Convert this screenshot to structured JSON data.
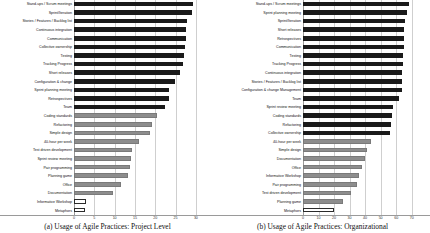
{
  "figure": {
    "caption_left": "(a) Usage of Agile Practices: Project Level",
    "caption_right": "(b) Usage of Agile Practices: Organizational"
  },
  "chart_data": [
    {
      "type": "bar",
      "title": "",
      "orientation": "horizontal",
      "panel": "a",
      "xlabel": "",
      "ylabel": "",
      "xlim": [
        0,
        32
      ],
      "grid": true,
      "legend": "none",
      "tick_labels": [
        "0",
        "5",
        "10",
        "15",
        "20",
        "25",
        "30"
      ],
      "tick_values": [
        0,
        5,
        10,
        15,
        20,
        25,
        30
      ],
      "categories": [
        "Stand-ups / Scrum meetings",
        "Sprint/Iteration",
        "Stories / Features / Backlog list",
        "Continuous integration",
        "Communication",
        "Collective ownership",
        "Testing",
        "Tracking Progress",
        "Short releases",
        "Configuration & change",
        "Sprint planning meeting",
        "Retrospectives",
        "Team",
        "Coding standards",
        "Refactoring",
        "Simple design",
        "40-hour per week",
        "Test driven development",
        "Sprint review meeting",
        "Pair programming",
        "Planning game",
        "Office",
        "Documentation",
        "Informative Workshop",
        "Metaphors"
      ],
      "values": [
        29.2,
        29.0,
        27.8,
        27.6,
        27.5,
        27.4,
        27.0,
        26.9,
        26.2,
        24.8,
        23.5,
        23.3,
        22.5,
        20.5,
        19.2,
        18.8,
        16.0,
        14.2,
        14.0,
        13.9,
        13.3,
        11.6,
        9.6,
        3.0,
        2.6
      ],
      "bar_styles": [
        "dark",
        "dark",
        "dark",
        "dark",
        "dark",
        "dark",
        "dark",
        "dark",
        "dark",
        "dark",
        "dark",
        "dark",
        "dark",
        "gray",
        "gray",
        "gray",
        "gray",
        "gray",
        "gray",
        "gray",
        "gray",
        "gray",
        "gray",
        "white",
        "white"
      ]
    },
    {
      "type": "bar",
      "title": "",
      "orientation": "horizontal",
      "panel": "b",
      "xlabel": "",
      "ylabel": "",
      "xlim": [
        0,
        76
      ],
      "grid": true,
      "legend": "none",
      "tick_labels": [
        "0",
        "10",
        "20",
        "30",
        "40",
        "50",
        "60",
        "70"
      ],
      "tick_values": [
        0,
        10,
        20,
        30,
        40,
        50,
        60,
        70
      ],
      "categories": [
        "Stand-ups / Scrum meetings",
        "Sprint planning meeting",
        "Sprint/Iteration",
        "Short releases",
        "Retrospectives",
        "Communication",
        "Testing",
        "Tracking Progress",
        "Continuous integration",
        "Stories / Features / Backlog list",
        "Configuration & change Management",
        "Team",
        "Sprint review meeting",
        "Coding standards",
        "Refactoring",
        "Collective ownership",
        "40-hour per week",
        "Simple design",
        "Documentation",
        "Office",
        "Informative Workshop",
        "Pair programming",
        "Test driven development",
        "Planning game",
        "Metaphors"
      ],
      "values": [
        68.5,
        66.8,
        65.5,
        65.3,
        65.0,
        64.8,
        64.5,
        64.3,
        64.0,
        63.8,
        63.5,
        62.0,
        58.0,
        57.0,
        56.5,
        56.0,
        44.0,
        41.0,
        40.0,
        38.0,
        36.0,
        34.5,
        31.0,
        26.0,
        20.0
      ],
      "bar_styles": [
        "dark",
        "dark",
        "dark",
        "dark",
        "dark",
        "dark",
        "dark",
        "dark",
        "dark",
        "dark",
        "dark",
        "dark",
        "dark",
        "dark",
        "dark",
        "dark",
        "gray",
        "gray",
        "gray",
        "gray",
        "gray",
        "gray",
        "gray",
        "gray",
        "white"
      ]
    }
  ]
}
